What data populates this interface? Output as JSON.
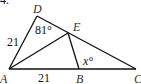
{
  "problem_number": "4.",
  "points": {
    "A": {
      "label": "A",
      "x": 9,
      "y": 69
    },
    "B": {
      "label": "B",
      "x": 79,
      "y": 69
    },
    "C": {
      "label": "C",
      "x": 136,
      "y": 69
    },
    "D": {
      "label": "D",
      "x": 37,
      "y": 16
    },
    "E": {
      "label": "E",
      "x": 68,
      "y": 33
    }
  },
  "segments": [
    [
      "A",
      "D"
    ],
    [
      "D",
      "C"
    ],
    [
      "A",
      "C"
    ],
    [
      "A",
      "E"
    ],
    [
      "E",
      "B"
    ]
  ],
  "annotations": {
    "side_AD": "21",
    "side_AB": "21",
    "angle_D": "81°",
    "angle_B": "x°"
  },
  "colors": {
    "line": "#111111",
    "label": "#333333"
  }
}
